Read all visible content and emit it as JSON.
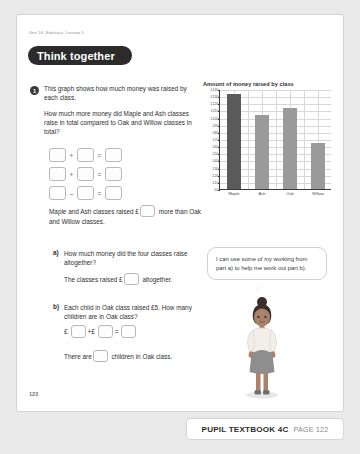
{
  "page": {
    "unit_line": "Unit 14: Statistics, Lesson 5",
    "banner_label": "Think together",
    "page_number": "122"
  },
  "question": {
    "number": "1",
    "line1": "This graph shows how much money was raised by each class.",
    "line2": "How much more money did Maple and Ash classes raise in total compared to Oak and Willow classes in total?",
    "equation_rows": [
      {
        "op": "+"
      },
      {
        "op": "+"
      },
      {
        "op": "–"
      }
    ],
    "sentence_before": "Maple and Ash classes raised £",
    "sentence_after": "more than Oak and Willow classes."
  },
  "part_a": {
    "label": "a)",
    "text": "How much money did the four classes raise altogether?",
    "answer_before": "The classes raised £",
    "answer_after": "altogether."
  },
  "part_b": {
    "label": "b)",
    "text": "Each child in Oak class raised £5. How many children are in Oak class?",
    "currency": "£",
    "plus": "+",
    "equals": "=",
    "answer_before": "There are",
    "answer_after": "children in Oak class."
  },
  "bubble": {
    "text": "I can use some of my working from part a) to help me work out part b)."
  },
  "footer": {
    "title": "PUPIL TEXTBOOK 4C",
    "page": "PAGE 122"
  },
  "colors": {
    "bar_highlight": "#5a5a5a",
    "bar_normal": "#9a9a9a",
    "axis": "#3a3a3a",
    "grid": "#d8d8d8",
    "banner_bg": "#2b2b2b"
  },
  "chart_data": {
    "type": "bar",
    "title": "Amount of money raised by class",
    "categories": [
      "Maple",
      "Ash",
      "Oak",
      "Willow"
    ],
    "values": [
      133,
      104,
      113,
      64
    ],
    "xlabel": "",
    "ylabel": "",
    "ylim": [
      0,
      140
    ],
    "ytick_step": 10,
    "ytick_labels": [
      "£0",
      "£10",
      "£20",
      "£30",
      "£40",
      "£50",
      "£60",
      "£70",
      "£80",
      "£90",
      "£100",
      "£110",
      "£120",
      "£130",
      "£140"
    ],
    "grid": true,
    "legend": "none",
    "bar_colors": [
      "#5a5a5a",
      "#9a9a9a",
      "#9a9a9a",
      "#9a9a9a"
    ]
  }
}
